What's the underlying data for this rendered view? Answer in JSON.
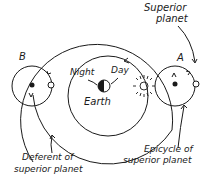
{
  "diagram": {
    "labels": {
      "superior_planet": [
        "Superior",
        "planet"
      ],
      "point_a": "A",
      "point_b": "B",
      "night": "Night",
      "day": "Day",
      "earth": "Earth",
      "epicycle": [
        "Epicycle of",
        "superior planet"
      ],
      "deferent": [
        "Deferent of",
        "superior planet"
      ]
    },
    "colors": {
      "ink": "#1a1a1a",
      "background": "#ffffff"
    }
  }
}
